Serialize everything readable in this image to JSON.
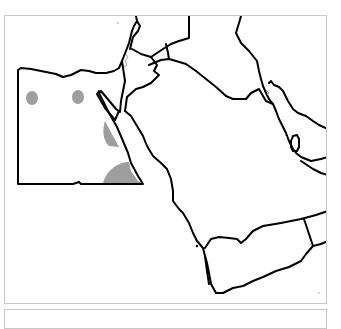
{
  "map": {
    "title": "",
    "type": "outline map",
    "region": "Egypt and Arabian Peninsula",
    "highlight_color": "#9e9e9e",
    "border_color": "#000000",
    "frame_color": "#c8c8c8",
    "highlighted_areas": [
      {
        "name": "west-oasis-1"
      },
      {
        "name": "west-oasis-2"
      },
      {
        "name": "red-sea-coast-area"
      },
      {
        "name": "southeast-egypt-area"
      }
    ]
  },
  "caption": {
    "text": ""
  }
}
